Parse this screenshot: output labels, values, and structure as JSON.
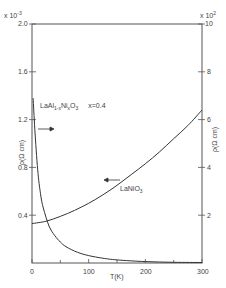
{
  "chart_data": {
    "type": "line",
    "title": "",
    "xlabel": "T (K)",
    "xlim": [
      0,
      300
    ],
    "x_ticks": [
      0,
      100,
      200,
      300
    ],
    "x_minor_ticks": [
      50,
      150,
      250
    ],
    "left_axis": {
      "label": "ρ (Ω cm)",
      "multiplier": "x 10⁻³",
      "ylim": [
        0,
        2.0
      ],
      "ticks": [
        0.4,
        0.8,
        1.2,
        1.6,
        2.0
      ],
      "tick_labels": [
        "0.4",
        "0.8",
        "1.2",
        "1.6",
        "2.0"
      ]
    },
    "right_axis": {
      "label": "ρ (Ω cm)",
      "multiplier": "x 10²",
      "ylim": [
        0,
        10
      ],
      "ticks": [
        2,
        4,
        6,
        8,
        10
      ],
      "tick_labels": [
        "2",
        "4",
        "6",
        "8",
        "10"
      ]
    },
    "series": [
      {
        "name": "LaNiO3",
        "axis": "left",
        "arrow_direction": "left",
        "x": [
          0,
          25,
          50,
          75,
          100,
          125,
          150,
          175,
          200,
          225,
          250,
          275,
          300
        ],
        "values": [
          0.33,
          0.35,
          0.39,
          0.44,
          0.5,
          0.57,
          0.65,
          0.74,
          0.83,
          0.93,
          1.04,
          1.15,
          1.28
        ]
      },
      {
        "name": "LaAl1-xNixO3 x=0.4",
        "axis": "right",
        "arrow_direction": "right",
        "x": [
          2,
          5,
          10,
          15,
          20,
          30,
          40,
          50,
          60,
          80,
          100,
          125,
          150,
          200,
          250,
          300
        ],
        "values": [
          6.9,
          5.6,
          3.9,
          2.9,
          2.3,
          1.55,
          1.15,
          0.88,
          0.68,
          0.45,
          0.31,
          0.2,
          0.13,
          0.06,
          0.03,
          0.02
        ]
      }
    ],
    "annotations": [
      {
        "text": "LaAl1-xNixO3  x=0.4",
        "near": "upper-left"
      },
      {
        "text": "LaNiO3",
        "near": "center-right"
      }
    ],
    "grid": false,
    "legend": "none (inline labels with arrows)"
  },
  "labels": {
    "left_mult_base": "x 10",
    "left_mult_exp": "-3",
    "right_mult_base": "x 10",
    "right_mult_exp": "2",
    "left_ticks": [
      "2.0",
      "1.6",
      "1.2",
      "0.8",
      "0.4"
    ],
    "right_ticks": [
      "10",
      "8",
      "6",
      "4",
      "2"
    ],
    "x_ticks": [
      "0",
      "100",
      "200",
      "300"
    ],
    "xlabel": "T(K)",
    "ylabel_left": "ρ(Ω cm)",
    "ylabel_right": "ρ(Ω cm)",
    "series1_prefix": "LaAl",
    "series1_sub1": "1-x",
    "series1_mid": "Ni",
    "series1_sub2": "x",
    "series1_end": "O",
    "series1_sub3": "3",
    "series1_x": "x=0.4",
    "series2_prefix": "LaNiO",
    "series2_sub": "3"
  }
}
